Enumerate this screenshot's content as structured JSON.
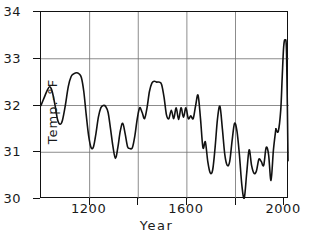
{
  "chart_data": {
    "type": "line",
    "title": "",
    "xlabel": "Year",
    "ylabel": "Temp.-°F",
    "xlim": [
      1000,
      2020
    ],
    "ylim": [
      30,
      34
    ],
    "grid": true,
    "legend_position": "none",
    "xticks": [
      {
        "value": 1200,
        "label": "1200",
        "major": true
      },
      {
        "value": 1400,
        "label": "",
        "major": false
      },
      {
        "value": 1600,
        "label": "1600",
        "major": true
      },
      {
        "value": 1800,
        "label": "",
        "major": false
      },
      {
        "value": 2000,
        "label": "2000",
        "major": true
      }
    ],
    "yticks": [
      {
        "value": 30,
        "label": "30"
      },
      {
        "value": 31,
        "label": "31"
      },
      {
        "value": 32,
        "label": "32"
      },
      {
        "value": 33,
        "label": "33"
      },
      {
        "value": 34,
        "label": "34"
      }
    ],
    "gridlines": {
      "x": [
        1200,
        1400,
        1600,
        1800
      ],
      "y": [
        31,
        32,
        33
      ]
    },
    "line_color": "#111111",
    "line_width": 1.6,
    "series": [
      {
        "name": "Temperature",
        "x": [
          1000,
          1014,
          1026,
          1036,
          1046,
          1058,
          1068,
          1078,
          1088,
          1100,
          1112,
          1124,
          1136,
          1146,
          1156,
          1166,
          1176,
          1186,
          1196,
          1206,
          1216,
          1226,
          1236,
          1246,
          1256,
          1266,
          1276,
          1286,
          1296,
          1306,
          1316,
          1326,
          1336,
          1346,
          1356,
          1366,
          1376,
          1386,
          1396,
          1406,
          1416,
          1426,
          1436,
          1446,
          1456,
          1466,
          1476,
          1486,
          1496,
          1506,
          1516,
          1526,
          1536,
          1546,
          1556,
          1566,
          1576,
          1586,
          1596,
          1606,
          1616,
          1626,
          1636,
          1646,
          1656,
          1666,
          1676,
          1686,
          1696,
          1706,
          1716,
          1726,
          1736,
          1746,
          1756,
          1766,
          1776,
          1786,
          1796,
          1806,
          1816,
          1826,
          1836,
          1846,
          1856,
          1866,
          1876,
          1886,
          1896,
          1906,
          1916,
          1926,
          1936,
          1946,
          1956,
          1966
        ],
        "y": [
          32.0,
          32.18,
          32.33,
          32.4,
          32.3,
          32.0,
          31.7,
          31.6,
          31.68,
          32.0,
          32.4,
          32.62,
          32.68,
          32.7,
          32.68,
          32.6,
          32.3,
          31.8,
          31.35,
          31.1,
          31.12,
          31.4,
          31.75,
          31.95,
          32.0,
          31.98,
          31.85,
          31.5,
          31.12,
          30.87,
          31.1,
          31.45,
          31.62,
          31.4,
          31.12,
          31.08,
          31.1,
          31.35,
          31.72,
          31.95,
          31.85,
          31.72,
          31.95,
          32.3,
          32.48,
          32.52,
          32.5,
          32.5,
          32.45,
          32.18,
          31.8,
          31.72,
          31.9,
          31.72,
          31.95,
          31.7,
          31.95,
          31.75,
          31.95,
          31.72,
          31.78,
          31.72,
          32.0,
          32.22,
          31.72,
          31.1,
          31.22,
          30.8,
          30.56,
          30.62,
          31.1,
          31.72,
          31.98,
          31.5,
          30.95,
          30.72,
          30.8,
          31.25,
          31.62,
          31.45,
          30.95,
          30.3,
          30.02,
          30.55,
          31.05,
          30.72,
          30.55,
          30.6,
          30.85,
          30.8,
          30.72,
          31.1,
          30.95,
          30.4,
          31.05,
          31.5
        ]
      },
      {
        "name": "Temperature (continued)",
        "x": [
          1966,
          1976,
          1986,
          1992,
          1998,
          2004,
          2010,
          2016
        ],
        "y": [
          31.5,
          31.45,
          31.9,
          32.6,
          33.25,
          33.4,
          33.1,
          30.82
        ]
      }
    ]
  }
}
